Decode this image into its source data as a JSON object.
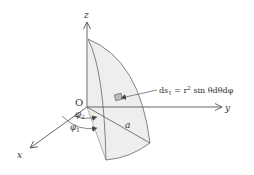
{
  "diagram": {
    "type": "spherical-surface-element",
    "axes": {
      "z_label": "z",
      "y_label": "y",
      "x_label": "x",
      "origin_label": "O"
    },
    "labels": {
      "radius": "a",
      "phi2": "φ",
      "phi2_sub": "2",
      "phi1": "φ",
      "phi1_sub": "1",
      "element_formula_lhs": "ds",
      "element_formula_lhs_sub": "1",
      "element_formula_eq": " = r",
      "element_formula_sup": "2",
      "element_formula_rhs": " sin θdθdφ"
    },
    "colors": {
      "stroke": "#555555",
      "fill": "#eeeeee",
      "element_fill": "#bbbbbb"
    }
  }
}
